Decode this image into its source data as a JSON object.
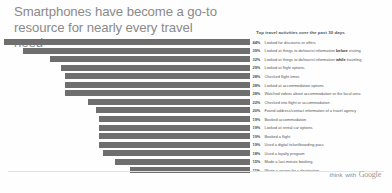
{
  "headline": "Smartphones have become a go-to resource for nearly every travel need",
  "panel_title": "Top travel activities over the past 30 days",
  "brand": {
    "prefix": "think",
    "with": "with",
    "google": "Google"
  },
  "colors": {
    "bar": "#6e6e6e",
    "headline": "#8a8a8a",
    "text": "#555555"
  },
  "chart_data": {
    "type": "bar",
    "orientation": "horizontal",
    "title": "Top travel activities over the past 30 days",
    "xlabel": "",
    "ylabel": "",
    "xlim": [
      0,
      44
    ],
    "grid": false,
    "legend": false,
    "categories": [
      "Looked for discounts or offers",
      "Looked at things to do/tourist information before visiting",
      "Looked at things to do/tourist information while traveling",
      "Looked at flight options",
      "Checked flight times",
      "Looked at accommodation options",
      "Watched videos about accommodation or the local area",
      "Checked into flight or accommodation",
      "Found address/contact information of a travel agency",
      "Booked accommodation",
      "Looked at rental car options",
      "Booked a flight",
      "Used a digital ticket/boarding pass",
      "Used a loyalty program",
      "Made a last-minute booking",
      "Wrote a review for a destination"
    ],
    "values": [
      44,
      39,
      32,
      29,
      28,
      28,
      28,
      22,
      20,
      19,
      19,
      19,
      19,
      18,
      15,
      11
    ],
    "data_labels": [
      "44%",
      "39%",
      "32%",
      "29%",
      "28%",
      "28%",
      "28%",
      "22%",
      "20%",
      "19%",
      "19%",
      "19%",
      "19%",
      "18%",
      "15%",
      "11%"
    ]
  },
  "rows": [
    {
      "pct": "44%",
      "value": 44,
      "pre": "Looked for discounts or offers",
      "strong": "",
      "post": ""
    },
    {
      "pct": "39%",
      "value": 39,
      "pre": "Looked at things to do/tourist information ",
      "strong": "before",
      "post": " visiting"
    },
    {
      "pct": "32%",
      "value": 32,
      "pre": "Looked at things to do/tourist information ",
      "strong": "while",
      "post": " traveling"
    },
    {
      "pct": "29%",
      "value": 29,
      "pre": "Looked at flight options",
      "strong": "",
      "post": ""
    },
    {
      "pct": "28%",
      "value": 28,
      "pre": "Checked flight times",
      "strong": "",
      "post": ""
    },
    {
      "pct": "28%",
      "value": 28,
      "pre": "Looked at accommodation options",
      "strong": "",
      "post": ""
    },
    {
      "pct": "28%",
      "value": 28,
      "pre": "Watched videos about accommodation or the local area",
      "strong": "",
      "post": ""
    },
    {
      "pct": "22%",
      "value": 22,
      "pre": "Checked into flight or accommodation",
      "strong": "",
      "post": ""
    },
    {
      "pct": "20%",
      "value": 20,
      "pre": "Found address/contact information of a travel agency",
      "strong": "",
      "post": ""
    },
    {
      "pct": "19%",
      "value": 19,
      "pre": "Booked accommodation",
      "strong": "",
      "post": ""
    },
    {
      "pct": "19%",
      "value": 19,
      "pre": "Looked at rental car options",
      "strong": "",
      "post": ""
    },
    {
      "pct": "19%",
      "value": 19,
      "pre": "Booked a flight",
      "strong": "",
      "post": ""
    },
    {
      "pct": "19%",
      "value": 19,
      "pre": "Used a digital ticket/boarding pass",
      "strong": "",
      "post": ""
    },
    {
      "pct": "18%",
      "value": 18,
      "pre": "Used a loyalty program",
      "strong": "",
      "post": ""
    },
    {
      "pct": "15%",
      "value": 15,
      "pre": "Made a last-minute booking",
      "strong": "",
      "post": ""
    },
    {
      "pct": "11%",
      "value": 11,
      "pre": "Wrote a review for a destination",
      "strong": "",
      "post": ""
    }
  ]
}
